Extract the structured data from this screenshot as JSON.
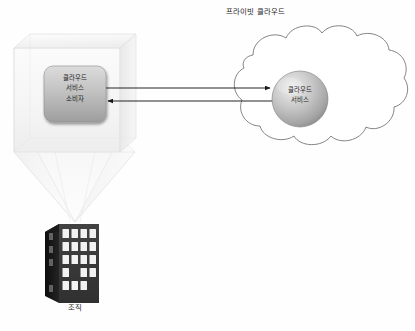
{
  "diagram": {
    "title_private_cloud": "프라이빗 클라우드",
    "organization_label": "조직",
    "consumer_node": {
      "line1": "클라우드",
      "line2": "서비스",
      "line3": "소비자"
    },
    "service_node": {
      "line1": "클라우드",
      "line2": "서비스"
    },
    "colors": {
      "background": "#fefefe",
      "cloud_stroke": "#6e6e6e",
      "arrow": "#1a1a1a",
      "node_fill_light": "#d8d8d8",
      "node_fill_dark": "#9a9a9a",
      "sphere_light": "#e8e8e8",
      "sphere_dark": "#8d8d8d",
      "building_front": "#3a3a3a",
      "building_side": "#151515",
      "building_window": "#f2f2f2",
      "glass_box": "#f4f4f4",
      "text": "#1c1c1c"
    }
  }
}
